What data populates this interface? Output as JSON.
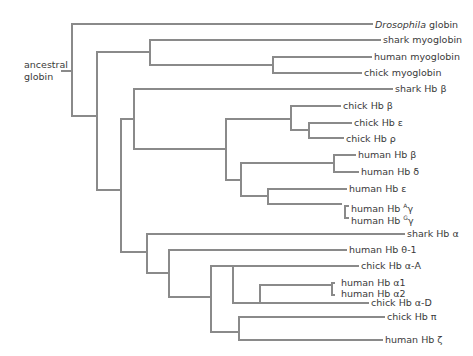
{
  "diagram": {
    "type": "phylogenetic-tree",
    "line_color": "#8a8a8a",
    "text_color": "#3a3a3a",
    "root_label_line1": "ancestral",
    "root_label_line2": "globin",
    "leaves": [
      {
        "id": "drosophila",
        "prefix": "Drosophila",
        "suffix": " globin",
        "italic_prefix": true
      },
      {
        "id": "shark-myo",
        "label": "shark myoglobin"
      },
      {
        "id": "human-myo",
        "label": "human myoglobin"
      },
      {
        "id": "chick-myo",
        "label": "chick myoglobin"
      },
      {
        "id": "shark-hbb",
        "label": "shark Hb β"
      },
      {
        "id": "chick-hbb",
        "label": "chick Hb β"
      },
      {
        "id": "chick-hbe",
        "label": "chick Hb ε"
      },
      {
        "id": "chick-hbr",
        "label": "chick Hb ρ"
      },
      {
        "id": "human-hbb",
        "label": "human Hb β"
      },
      {
        "id": "human-hbd",
        "label": "human Hb δ"
      },
      {
        "id": "human-hbe",
        "label": "human Hb ε"
      },
      {
        "id": "human-hbag",
        "label": "human Hb ",
        "sup": "A",
        "tail": "γ"
      },
      {
        "id": "human-hbgg",
        "label": "human Hb ",
        "sup": "G",
        "tail": "γ"
      },
      {
        "id": "shark-hba",
        "label": "shark Hb α"
      },
      {
        "id": "human-hbth",
        "label": "human Hb θ-1"
      },
      {
        "id": "chick-hbaa",
        "label": "chick Hb α-A"
      },
      {
        "id": "human-hba1",
        "label": "human Hb α1"
      },
      {
        "id": "human-hba2",
        "label": "human Hb α2"
      },
      {
        "id": "chick-hbad",
        "label": "chick Hb α-D"
      },
      {
        "id": "chick-hbpi",
        "label": "chick Hb π"
      },
      {
        "id": "human-hbz",
        "label": "human Hb ζ"
      }
    ]
  }
}
